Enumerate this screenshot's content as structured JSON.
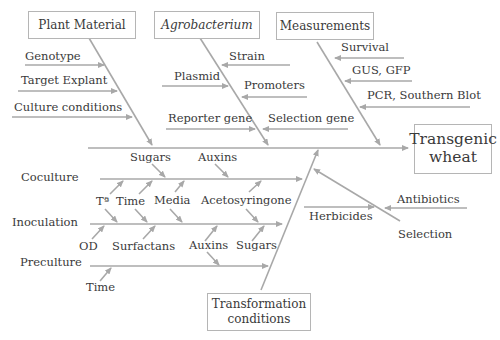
{
  "diagram": {
    "type": "fishbone",
    "effect": {
      "label_line1": "Transgenic",
      "label_line2": "wheat"
    },
    "categories": {
      "plant_material": {
        "label": "Plant Material",
        "causes": [
          "Genotype",
          "Target Explant",
          "Culture conditions"
        ]
      },
      "agrobacterium": {
        "label": "Agrobacterium",
        "causes": [
          "Strain",
          "Plasmid",
          "Promoters",
          "Reporter gene",
          "Selection gene"
        ]
      },
      "measurements": {
        "label": "Measurements",
        "causes": [
          "Survival",
          "GUS, GFP",
          "PCR, Southern Blot"
        ]
      },
      "transformation_conditions": {
        "label_line1": "Transformation",
        "label_line2": "conditions",
        "stages": {
          "coculture": {
            "label": "Coculture",
            "causes": [
              "Sugars",
              "Auxins",
              "Tª",
              "Time",
              "Media",
              "Acetosyringone"
            ]
          },
          "inoculation": {
            "label": "Inoculation",
            "causes": [
              "OD",
              "Surfactans",
              "Auxins",
              "Sugars"
            ]
          },
          "preculture": {
            "label": "Preculture",
            "causes": [
              "Time"
            ]
          }
        }
      },
      "selection": {
        "label": "Selection",
        "causes": [
          "Antibiotics",
          "Herbicides"
        ]
      }
    },
    "colors": {
      "arrow": "#a8a8a8",
      "text": "#3a3a3a",
      "box_border": "#b5b5b5"
    }
  }
}
